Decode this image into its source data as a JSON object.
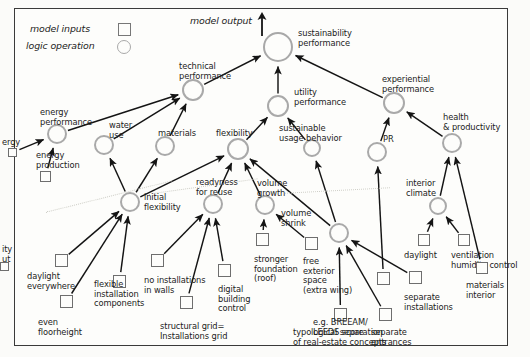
{
  "diagram": {
    "legend": {
      "model_inputs_label": "model inputs",
      "logic_operation_label": "logic operation",
      "input_symbol": "square-icon",
      "operation_symbol": "circle-icon"
    },
    "annotations": {
      "model_output": "model output"
    },
    "colors": {
      "node_ring": "#a9a9a9",
      "input_border": "#6e6e6e",
      "edge": "#1a1a1a",
      "frame": "#3a3a3a",
      "background": "#fdfdfb",
      "separator": "#cfcfc8"
    },
    "nodes": [
      {
        "id": "sustainability_performance",
        "label": "sustainability\nperformance",
        "type": "logic",
        "x": 278,
        "y": 47,
        "r": 15
      },
      {
        "id": "technical_performance",
        "label": "technical\nperformance",
        "type": "logic",
        "x": 193,
        "y": 90,
        "r": 11
      },
      {
        "id": "utility_performance",
        "label": "utility\nperformance",
        "type": "logic",
        "x": 278,
        "y": 106,
        "r": 11
      },
      {
        "id": "experiential_performance",
        "label": "experiential\nperformance",
        "type": "logic",
        "x": 394,
        "y": 103,
        "r": 11
      },
      {
        "id": "energy_performance",
        "label": "energy\nperformance",
        "type": "logic",
        "x": 57,
        "y": 134,
        "r": 10
      },
      {
        "id": "water_use",
        "label": "water\nuse",
        "type": "logic",
        "x": 104,
        "y": 145,
        "r": 10
      },
      {
        "id": "materials",
        "label": "materials",
        "type": "logic",
        "x": 165,
        "y": 146,
        "r": 10
      },
      {
        "id": "flexibility",
        "label": "flexibility",
        "type": "logic",
        "x": 238,
        "y": 149,
        "r": 11
      },
      {
        "id": "sustainable_usage_behavior",
        "label": "sustainable\nusage behavior",
        "type": "logic",
        "x": 312,
        "y": 148,
        "r": 9
      },
      {
        "id": "pr",
        "label": "PR",
        "type": "logic",
        "x": 377,
        "y": 152,
        "r": 10
      },
      {
        "id": "health_productivity",
        "label": "health\n& productivity",
        "type": "logic",
        "x": 452,
        "y": 143,
        "r": 10
      },
      {
        "id": "initial_flexibility",
        "label": "initial\nflexibility",
        "type": "logic",
        "x": 130,
        "y": 202,
        "r": 10
      },
      {
        "id": "readyness_for_reuse",
        "label": "readyness\nfor reuse",
        "type": "logic",
        "x": 213,
        "y": 204,
        "r": 10
      },
      {
        "id": "volume_growth",
        "label": "volume\ngrowth",
        "type": "logic",
        "x": 265,
        "y": 205,
        "r": 10
      },
      {
        "id": "volume_shrink",
        "label": "volume\nshrink",
        "type": "logic",
        "x": 339,
        "y": 233,
        "r": 10
      },
      {
        "id": "interior_climate",
        "label": "interior\nclimate",
        "type": "logic",
        "x": 438,
        "y": 206,
        "r": 9
      }
    ],
    "inputs": [
      {
        "id": "energy_clipped",
        "label": "ergy",
        "lx": 2,
        "ly": 138,
        "x": 8,
        "y": 148,
        "w": 9,
        "h": 9,
        "clipped": true
      },
      {
        "id": "energy_production",
        "label": "energy\nproduction",
        "lx": 36,
        "ly": 151,
        "x": 40,
        "y": 171,
        "w": 11,
        "h": 11
      },
      {
        "id": "utility_clipped",
        "label": "ity\nut",
        "lx": 2,
        "ly": 245,
        "x": 0,
        "y": 262,
        "w": 9,
        "h": 9,
        "clipped": true
      },
      {
        "id": "daylight_everywhere",
        "label": "daylight\neverywhere",
        "lx": 27,
        "ly": 272,
        "x": 55,
        "y": 254,
        "w": 13,
        "h": 13
      },
      {
        "id": "even_floorheight",
        "label": "even\nfloorheight",
        "lx": 38,
        "ly": 318,
        "x": 60,
        "y": 295,
        "w": 13,
        "h": 13
      },
      {
        "id": "flexible_installation_components",
        "label": "flexible\ninstallation\ncomponents",
        "lx": 94,
        "ly": 280,
        "x": 113,
        "y": 275,
        "w": 13,
        "h": 13
      },
      {
        "id": "no_installations_in_walls",
        "label": "no installations\nin walls",
        "lx": 144,
        "ly": 276,
        "x": 151,
        "y": 254,
        "w": 13,
        "h": 13
      },
      {
        "id": "structural_grid",
        "label": "structural grid=\nInstallations grid",
        "lx": 160,
        "ly": 322,
        "x": 180,
        "y": 296,
        "w": 13,
        "h": 13
      },
      {
        "id": "digital_building_control",
        "label": "digital\nbuilding\ncontrol",
        "lx": 218,
        "ly": 285,
        "x": 218,
        "y": 264,
        "w": 13,
        "h": 13
      },
      {
        "id": "stronger_foundation_roof",
        "label": "stronger\nfoundation\n(roof)",
        "lx": 254,
        "ly": 255,
        "x": 256,
        "y": 233,
        "w": 13,
        "h": 13
      },
      {
        "id": "free_exterior_space",
        "label": "free\nexterior\nspace\n(extra wing)",
        "lx": 303,
        "ly": 257,
        "x": 305,
        "y": 237,
        "w": 13,
        "h": 13
      },
      {
        "id": "typological_separation",
        "label": "typological separation\nof real-estate concepts",
        "lx": 293,
        "ly": 328,
        "x": 334,
        "y": 308,
        "w": 13,
        "h": 13
      },
      {
        "id": "separate_entrances",
        "label": "separate\nentrances",
        "lx": 371,
        "ly": 328,
        "x": 379,
        "y": 308,
        "w": 13,
        "h": 13
      },
      {
        "id": "separate_installations",
        "label": "separate\ninstallations",
        "lx": 404,
        "ly": 293,
        "x": 409,
        "y": 271,
        "w": 13,
        "h": 13
      },
      {
        "id": "breeam_leeds_score",
        "label": "e.g. BREEAM/\nLEEDS score",
        "lx": 313,
        "ly": 318,
        "x": 377,
        "y": 272,
        "w": 13,
        "h": 13
      },
      {
        "id": "daylight",
        "label": "daylight",
        "lx": 404,
        "ly": 251,
        "x": 418,
        "y": 234,
        "w": 12,
        "h": 12
      },
      {
        "id": "ventilation_humidity_control",
        "label": "ventilation\nhumidity control",
        "lx": 451,
        "ly": 251,
        "x": 458,
        "y": 234,
        "w": 12,
        "h": 12
      },
      {
        "id": "materials_interior",
        "label": "materials\ninterior",
        "lx": 466,
        "ly": 281,
        "x": 476,
        "y": 262,
        "w": 12,
        "h": 12
      }
    ],
    "edges": [
      {
        "from": "technical_performance",
        "to": "sustainability_performance"
      },
      {
        "from": "utility_performance",
        "to": "sustainability_performance"
      },
      {
        "from": "experiential_performance",
        "to": "sustainability_performance"
      },
      {
        "from": "energy_performance",
        "to": "technical_performance"
      },
      {
        "from": "water_use",
        "to": "technical_performance"
      },
      {
        "from": "materials",
        "to": "technical_performance"
      },
      {
        "from": "flexibility",
        "to": "utility_performance"
      },
      {
        "from": "sustainable_usage_behavior",
        "to": "utility_performance"
      },
      {
        "from": "pr",
        "to": "experiential_performance"
      },
      {
        "from": "health_productivity",
        "to": "experiential_performance"
      },
      {
        "from": "energy_clipped",
        "to": "energy_performance"
      },
      {
        "from": "energy_production",
        "to": "energy_performance"
      },
      {
        "from": "initial_flexibility",
        "to": "water_use"
      },
      {
        "from": "initial_flexibility",
        "to": "materials"
      },
      {
        "from": "initial_flexibility",
        "to": "flexibility"
      },
      {
        "from": "readyness_for_reuse",
        "to": "flexibility"
      },
      {
        "from": "volume_growth",
        "to": "flexibility"
      },
      {
        "from": "volume_shrink",
        "to": "flexibility"
      },
      {
        "from": "volume_shrink",
        "to": "sustainable_usage_behavior"
      },
      {
        "from": "breeam_leeds_score",
        "to": "pr"
      },
      {
        "from": "interior_climate",
        "to": "health_productivity"
      },
      {
        "from": "materials_interior",
        "to": "health_productivity"
      },
      {
        "from": "daylight",
        "to": "interior_climate"
      },
      {
        "from": "ventilation_humidity_control",
        "to": "interior_climate"
      },
      {
        "from": "daylight_everywhere",
        "to": "initial_flexibility"
      },
      {
        "from": "even_floorheight",
        "to": "initial_flexibility"
      },
      {
        "from": "flexible_installation_components",
        "to": "initial_flexibility"
      },
      {
        "from": "no_installations_in_walls",
        "to": "readyness_for_reuse"
      },
      {
        "from": "structural_grid",
        "to": "readyness_for_reuse"
      },
      {
        "from": "digital_building_control",
        "to": "readyness_for_reuse"
      },
      {
        "from": "stronger_foundation_roof",
        "to": "volume_growth"
      },
      {
        "from": "free_exterior_space",
        "to": "volume_growth"
      },
      {
        "from": "typological_separation",
        "to": "volume_shrink"
      },
      {
        "from": "separate_entrances",
        "to": "volume_shrink"
      },
      {
        "from": "separate_installations",
        "to": "volume_shrink"
      }
    ]
  }
}
